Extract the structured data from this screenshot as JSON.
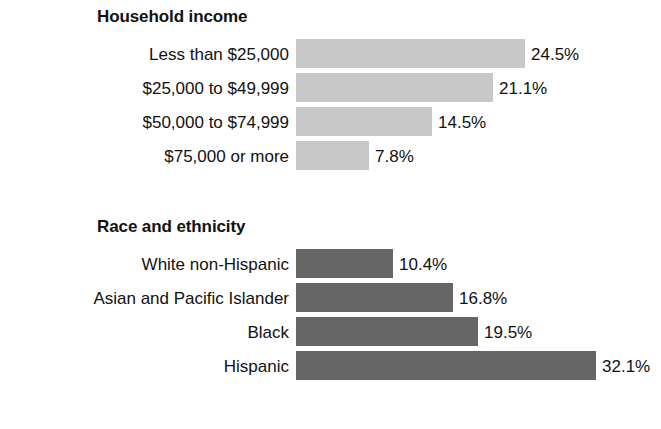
{
  "chart_data": {
    "type": "bar",
    "title": "",
    "xlabel": "",
    "ylabel": "",
    "unit": "%",
    "orientation": "horizontal",
    "grid": false,
    "legend": "none",
    "xlim": [
      0,
      32.1
    ],
    "panels": [
      {
        "title": "Household income",
        "bar_color": "#c8c8c8",
        "categories": [
          "Less than $25,000",
          "$25,000 to $49,999",
          "$50,000 to $74,999",
          "$75,000 or more"
        ],
        "values": [
          24.5,
          21.1,
          14.5,
          7.8
        ],
        "value_labels": [
          "24.5%",
          "21.1%",
          "14.5%",
          "7.8%"
        ]
      },
      {
        "title": "Race and ethnicity",
        "bar_color": "#666666",
        "categories": [
          "White non-Hispanic",
          "Asian and Pacific Islander",
          "Black",
          "Hispanic"
        ],
        "values": [
          10.4,
          16.8,
          19.5,
          32.1
        ],
        "value_labels": [
          "10.4%",
          "16.8%",
          "19.5%",
          "32.1%"
        ]
      }
    ]
  }
}
